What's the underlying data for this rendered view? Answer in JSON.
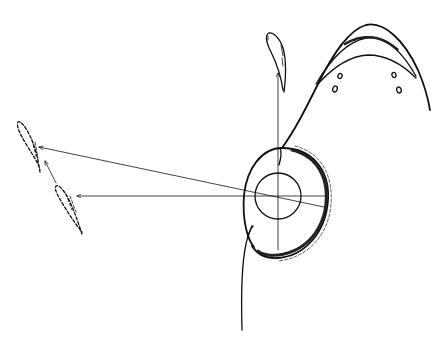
{
  "diagram": {
    "title": "",
    "background": "#ffffff",
    "ink_color": "#111111",
    "style": "hand-drawn line sketch, no text labels",
    "elements": {
      "outer_ellipse": {
        "cx": 278,
        "cy": 200,
        "rx": 50,
        "ry": 57,
        "rotation": -18,
        "rim": "hatched right side"
      },
      "inner_circle": {
        "cx": 278,
        "cy": 196,
        "r": 23
      },
      "vertical_axis": {
        "x": 278,
        "y_top": 72,
        "y_bottom": 250
      },
      "horizontal_axis": {
        "x_left": 77,
        "x_right": 328,
        "y": 196
      },
      "diagonal_ray": {
        "from": [
          325,
          207
        ],
        "to": [
          38,
          147
        ]
      },
      "stem_curve": {
        "from": [
          242,
          330
        ],
        "to": [
          250,
          225
        ]
      },
      "arc_curve": {
        "description": "parabolic lobe with three nested arcs and hatched band",
        "apex": [
          367,
          25
        ],
        "end": [
          430,
          110
        ]
      },
      "droplets": [
        {
          "name": "top-droplet",
          "position": [
            277,
            50
          ],
          "style": "solid"
        },
        {
          "name": "left-upper-droplet",
          "position": [
            25,
            138
          ],
          "style": "dashed"
        },
        {
          "name": "left-lower-droplet",
          "position": [
            65,
            200
          ],
          "style": "dashed"
        }
      ],
      "small_ovals": [
        {
          "cx": 340,
          "cy": 76
        },
        {
          "cx": 335,
          "cy": 89
        },
        {
          "cx": 394,
          "cy": 75
        },
        {
          "cx": 399,
          "cy": 90
        }
      ],
      "arrows": [
        {
          "name": "arrow-up",
          "from": [
            278,
            196
          ],
          "to": [
            278,
            72
          ]
        },
        {
          "name": "arrow-left-horizontal",
          "from": [
            278,
            196
          ],
          "to": [
            77,
            196
          ]
        },
        {
          "name": "arrow-left-diagonal",
          "from": [
            325,
            207
          ],
          "to": [
            38,
            147
          ]
        },
        {
          "name": "arrow-short-diagonal",
          "from": [
            55,
            183
          ],
          "to": [
            45,
            160
          ]
        }
      ]
    }
  }
}
